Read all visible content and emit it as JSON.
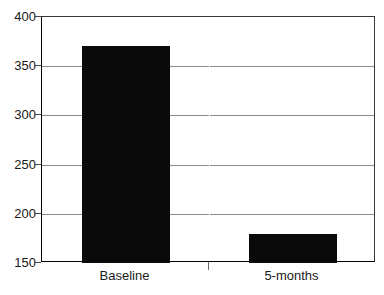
{
  "chart_data": {
    "type": "bar",
    "title": "",
    "title_note": "title is cropped off the top edge of the screenshot and is unreadable",
    "categories": [
      "Baseline",
      "5-months"
    ],
    "values": [
      371,
      179
    ],
    "xlabel": "",
    "ylabel": "",
    "ylim": [
      150,
      400
    ],
    "yticks": [
      150,
      200,
      250,
      300,
      350,
      400
    ],
    "ytick_labels": [
      "150",
      "200",
      "250",
      "300",
      "350",
      "400"
    ],
    "grid": true,
    "grid_axis": "y",
    "legend": false,
    "bar_color": "#0a0a0a",
    "grid_color": "#8c8c8c",
    "axis_color": "#000000",
    "background_color": "#ffffff"
  },
  "axes": {
    "y_ticks": [
      {
        "label": "400",
        "value": 400
      },
      {
        "label": "350",
        "value": 350
      },
      {
        "label": "300",
        "value": 300
      },
      {
        "label": "250",
        "value": 250
      },
      {
        "label": "200",
        "value": 200
      },
      {
        "label": "150",
        "value": 150
      }
    ],
    "x_ticks": [
      {
        "label": "Baseline"
      },
      {
        "label": "5-months"
      }
    ]
  },
  "bars": [
    {
      "label": "Baseline",
      "value": 371
    },
    {
      "label": "5-months",
      "value": 179
    }
  ]
}
